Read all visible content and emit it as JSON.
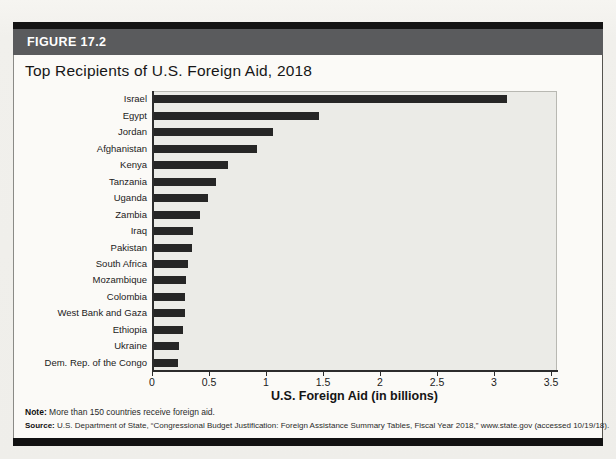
{
  "figure": {
    "label": "FIGURE 17.2",
    "title": "Top Recipients of U.S. Foreign Aid, 2018"
  },
  "chart_data": {
    "type": "bar",
    "orientation": "horizontal",
    "title": "Top Recipients of U.S. Foreign Aid, 2018",
    "categories": [
      "Israel",
      "Egypt",
      "Jordan",
      "Afghanistan",
      "Kenya",
      "Tanzania",
      "Uganda",
      "Zambia",
      "Iraq",
      "Pakistan",
      "South Africa",
      "Mozambique",
      "Colombia",
      "West Bank and Gaza",
      "Ethiopia",
      "Ukraine",
      "Dem. Rep. of the Congo"
    ],
    "values": [
      3.1,
      1.45,
      1.04,
      0.9,
      0.65,
      0.54,
      0.47,
      0.4,
      0.34,
      0.33,
      0.3,
      0.28,
      0.27,
      0.27,
      0.25,
      0.22,
      0.21
    ],
    "xlabel": "U.S. Foreign Aid (in billions)",
    "ylabel": "",
    "xlim": [
      0,
      3.5
    ],
    "xtick_labels": [
      "0",
      "0.5",
      "1",
      "1.5",
      "2",
      "2.5",
      "3",
      "3.5"
    ],
    "xtick_values": [
      0,
      0.5,
      1,
      1.5,
      2,
      2.5,
      3,
      3.5
    ],
    "grid": false,
    "legend": "none",
    "bar_color": "#262626",
    "plot_bg": "#ebebe7"
  },
  "note": {
    "label": "Note:",
    "text": "More than 150 countries receive foreign aid."
  },
  "source": {
    "label": "Source:",
    "text": "U.S. Department of State, “Congressional Budget Justification: Foreign Assistance Summary Tables, Fiscal Year 2018,” www.state.gov (accessed 10/19/18)."
  }
}
